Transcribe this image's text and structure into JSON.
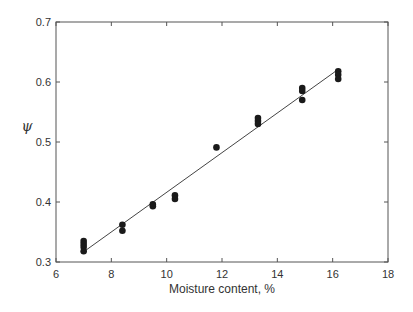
{
  "chart_data": {
    "type": "scatter",
    "title": "",
    "xlabel": "Moisture content, %",
    "ylabel": "ψ",
    "xlim": [
      6,
      18
    ],
    "ylim": [
      0.3,
      0.7
    ],
    "xticks": [
      6,
      8,
      10,
      12,
      14,
      16,
      18
    ],
    "yticks": [
      0.3,
      0.4,
      0.5,
      0.6,
      0.7
    ],
    "xtick_labels": [
      "6",
      "8",
      "10",
      "12",
      "14",
      "16",
      "18"
    ],
    "ytick_labels": [
      "0.3",
      "0.4",
      "0.5",
      "0.6",
      "0.7"
    ],
    "grid": false,
    "legend": null,
    "series": [
      {
        "name": "measured",
        "marker": "filled-circle",
        "color": "#1a1a1a",
        "points": [
          {
            "x": 7.0,
            "y": 0.335
          },
          {
            "x": 7.0,
            "y": 0.33
          },
          {
            "x": 7.0,
            "y": 0.325
          },
          {
            "x": 7.0,
            "y": 0.318
          },
          {
            "x": 8.4,
            "y": 0.362
          },
          {
            "x": 8.4,
            "y": 0.352
          },
          {
            "x": 9.5,
            "y": 0.396
          },
          {
            "x": 9.5,
            "y": 0.393
          },
          {
            "x": 10.3,
            "y": 0.411
          },
          {
            "x": 10.3,
            "y": 0.405
          },
          {
            "x": 11.8,
            "y": 0.491
          },
          {
            "x": 13.3,
            "y": 0.54
          },
          {
            "x": 13.3,
            "y": 0.535
          },
          {
            "x": 13.3,
            "y": 0.53
          },
          {
            "x": 14.9,
            "y": 0.59
          },
          {
            "x": 14.9,
            "y": 0.585
          },
          {
            "x": 14.9,
            "y": 0.57
          },
          {
            "x": 16.2,
            "y": 0.618
          },
          {
            "x": 16.2,
            "y": 0.612
          },
          {
            "x": 16.2,
            "y": 0.605
          }
        ]
      },
      {
        "name": "linear fit",
        "type": "line",
        "color": "#444444",
        "points": [
          {
            "x": 7.0,
            "y": 0.317
          },
          {
            "x": 16.2,
            "y": 0.621
          }
        ]
      }
    ]
  }
}
